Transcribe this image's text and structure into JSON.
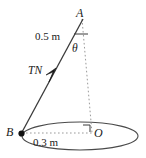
{
  "figure": {
    "background_color": "#ffffff",
    "stroke_color": "#3a3a3a",
    "dashed_color": "#8c8c8c",
    "text_color": "#1a1a1a",
    "width": 146,
    "height": 158,
    "points": [
      {
        "id": "A",
        "label": "A",
        "x": 82,
        "y": 18,
        "dot": false
      },
      {
        "id": "B",
        "label": "B",
        "x": 21,
        "y": 133,
        "dot": true
      },
      {
        "id": "O",
        "label": "O",
        "x": 92,
        "y": 133,
        "dot": false
      }
    ],
    "labels": {
      "point_a": "A",
      "point_b": "B",
      "point_o": "O",
      "angle": "θ",
      "force": "TN",
      "length_ab": "0.5 m",
      "length_bo": "0.3 m"
    },
    "segments": [
      {
        "name": "string-AB",
        "from": "A",
        "to": "B",
        "style": "solid",
        "measure": "0.5 m"
      },
      {
        "name": "axis-AO",
        "from": "A",
        "to": "O",
        "style": "dashed"
      },
      {
        "name": "radius-BO",
        "from": "B",
        "to": "O",
        "style": "dashed",
        "measure": "0.3 m"
      }
    ],
    "ellipse": {
      "name": "circular-path",
      "cx": 80,
      "cy": 136,
      "rx": 58,
      "ry": 14,
      "style": "solid"
    },
    "marks": {
      "right_angle_at": "O",
      "tick_on_string": true,
      "arrow_on_string_direction": "toward A"
    }
  }
}
